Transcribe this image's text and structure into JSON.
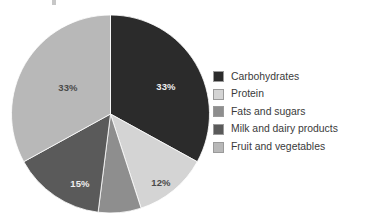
{
  "chart_data": {
    "type": "pie",
    "title": "",
    "xlabel": "",
    "ylabel": "",
    "legend_position": "right",
    "grid": false,
    "start_angle_deg": 0,
    "direction": "clockwise",
    "categories": [
      "Carbohydrates",
      "Protein",
      "Fats and sugars",
      "Milk and dairy products",
      "Fruit and vegetables"
    ],
    "values": [
      33,
      12,
      7,
      15,
      33
    ],
    "value_unit": "%",
    "colors": [
      "#2b2b2b",
      "#d4d4d4",
      "#8e8e8e",
      "#5a5a5a",
      "#b8b8b8"
    ],
    "slices": [
      {
        "name": "Carbohydrates",
        "value": 33,
        "label": "33%",
        "color": "#2b2b2b",
        "label_shown": true,
        "label_color": "#efefef",
        "label_x": 155,
        "label_y": 76
      },
      {
        "name": "Protein",
        "value": 12,
        "label": "12%",
        "color": "#d4d4d4",
        "label_shown": true,
        "label_color": "#4a4a4a",
        "label_x": 150,
        "label_y": 172
      },
      {
        "name": "Fats and sugars",
        "value": 7,
        "label": "",
        "color": "#8e8e8e",
        "label_shown": false,
        "label_color": "#4a4a4a",
        "label_x": 0,
        "label_y": 0
      },
      {
        "name": "Milk and dairy products",
        "value": 15,
        "label": "15%",
        "color": "#5a5a5a",
        "label_shown": true,
        "label_color": "#efefef",
        "label_x": 69,
        "label_y": 173
      },
      {
        "name": "Fruit and vegetables",
        "value": 33,
        "label": "33%",
        "color": "#b8b8b8",
        "label_shown": true,
        "label_color": "#4a4a4a",
        "label_x": 57,
        "label_y": 77
      }
    ]
  },
  "legend": {
    "items": [
      {
        "label": "Carbohydrates",
        "color": "#2b2b2b"
      },
      {
        "label": "Protein",
        "color": "#d4d4d4"
      },
      {
        "label": "Fats and sugars",
        "color": "#8e8e8e"
      },
      {
        "label": "Milk and dairy products",
        "color": "#5a5a5a"
      },
      {
        "label": "Fruit and vegetables",
        "color": "#b8b8b8"
      }
    ]
  }
}
